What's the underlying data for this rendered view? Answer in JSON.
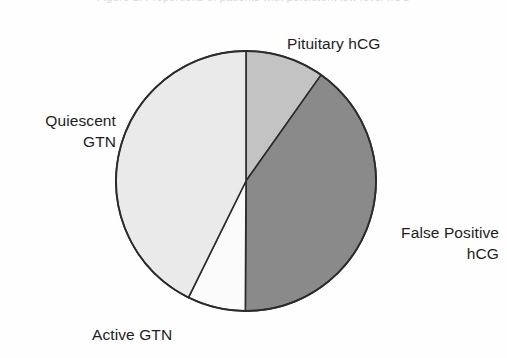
{
  "figure": {
    "cropped_caption_fragment": "Figure 1. Proportions of patients with persistent low level hCG",
    "background_color": "#fefefe",
    "outline_color": "#2b2b2b"
  },
  "chart_data": {
    "type": "pie",
    "title": "",
    "subtitle": "",
    "xlabel": "",
    "ylabel": "",
    "legend_position": "none",
    "labels_position": "outside",
    "grid": false,
    "start_angle_deg": 0,
    "direction": "clockwise",
    "center": {
      "x": 246,
      "y": 181
    },
    "radius": 130,
    "categories": [
      "Pituitary hCG",
      "False Positive hCG",
      "Active GTN",
      "Quiescent GTN"
    ],
    "values": [
      9.8,
      40.3,
      7.2,
      42.7
    ],
    "value_unit": "percent",
    "angles_deg": [
      35.3,
      145.0,
      26.0,
      153.7
    ],
    "colors": [
      "#c3c3c3",
      "#8a8a8a",
      "#fbfbfb",
      "#eaeaea"
    ],
    "slices": [
      {
        "name": "Pituitary hCG",
        "value": 9.8,
        "angle_deg": 35.3,
        "color": "#c3c3c3",
        "label": "Pituitary hCG",
        "label_lines": [
          "Pituitary hCG"
        ]
      },
      {
        "name": "False Positive hCG",
        "value": 40.3,
        "angle_deg": 145.0,
        "color": "#8a8a8a",
        "label": "False Positive hCG",
        "label_lines": [
          "False Positive",
          "hCG"
        ]
      },
      {
        "name": "Active GTN",
        "value": 7.2,
        "angle_deg": 26.0,
        "color": "#fbfbfb",
        "label": "Active GTN",
        "label_lines": [
          "Active GTN"
        ]
      },
      {
        "name": "Quiescent GTN",
        "value": 42.7,
        "angle_deg": 153.7,
        "color": "#eaeaea",
        "label": "Quiescent GTN",
        "label_lines": [
          "Quiescent",
          "GTN"
        ]
      }
    ]
  },
  "labels": {
    "pituitary": {
      "line1": "Pituitary hCG"
    },
    "false_positive": {
      "line1": "False Positive",
      "line2": "hCG"
    },
    "quiescent": {
      "line1": "Quiescent",
      "line2": "GTN"
    },
    "active": {
      "line1": "Active GTN"
    }
  }
}
